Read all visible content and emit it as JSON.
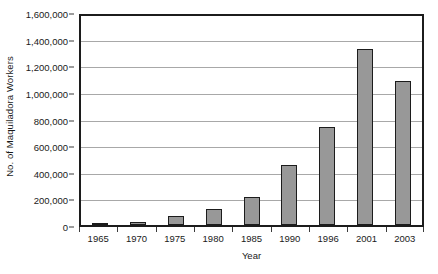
{
  "chart_data": {
    "type": "bar",
    "title": "",
    "xlabel": "Year",
    "ylabel": "No. of Maquiladora Workers",
    "categories": [
      "1965",
      "1970",
      "1975",
      "1980",
      "1985",
      "1990",
      "1996",
      "2001",
      "2003"
    ],
    "values": [
      3000,
      20000,
      67000,
      120000,
      212000,
      460000,
      754000,
      1350000,
      1100000
    ],
    "ylim": [
      0,
      1600000
    ],
    "y_ticks": [
      0,
      200000,
      400000,
      600000,
      800000,
      1000000,
      1200000,
      1400000,
      1600000
    ],
    "y_tick_labels": [
      "0",
      "200,000",
      "400,000",
      "600,000",
      "800,000",
      "1,000,000",
      "1,200,000",
      "1,400,000",
      "1,600,000"
    ],
    "grid": true,
    "legend": false,
    "bar_color": "#989898",
    "bar_border_color": "#1c1c1c",
    "gridline_color": "#a8a8a8",
    "axis_color": "#1c1c1c"
  }
}
